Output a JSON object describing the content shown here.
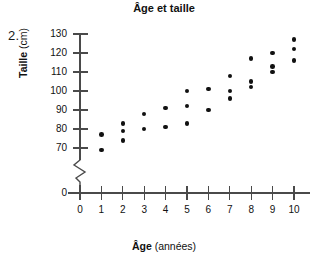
{
  "question_number": "2.",
  "chart_data": {
    "type": "scatter",
    "title": "Âge et taille",
    "xlabel": "Âge (années)",
    "xlabel_bold_part": "Âge",
    "xlabel_rest": " (années)",
    "ylabel": "Taille (cm)",
    "ylabel_bold_part": "Taille",
    "ylabel_unit": " (cm)",
    "xlim": [
      0,
      10
    ],
    "ylim": [
      65,
      132
    ],
    "y_axis_break": true,
    "y_break_note": "axis broken between 0 and 65",
    "grid": false,
    "legend": false,
    "xticks": [
      0,
      1,
      2,
      3,
      4,
      5,
      6,
      7,
      8,
      9,
      10
    ],
    "xtick_labels": [
      "0",
      "1",
      "2",
      "3",
      "4",
      "5",
      "6",
      "7",
      "8",
      "9",
      "10"
    ],
    "yticks": [
      70,
      80,
      90,
      100,
      110,
      120,
      130
    ],
    "ytick_labels": [
      "70",
      "80",
      "90",
      "100",
      "110",
      "120",
      "130"
    ],
    "y_zero_label": "0",
    "points": [
      {
        "x": 1,
        "y": 77
      },
      {
        "x": 1,
        "y": 69
      },
      {
        "x": 2,
        "y": 83
      },
      {
        "x": 2,
        "y": 79
      },
      {
        "x": 2,
        "y": 74
      },
      {
        "x": 3,
        "y": 88
      },
      {
        "x": 3,
        "y": 80
      },
      {
        "x": 4,
        "y": 91
      },
      {
        "x": 4,
        "y": 81
      },
      {
        "x": 5,
        "y": 100
      },
      {
        "x": 5,
        "y": 92
      },
      {
        "x": 5,
        "y": 83
      },
      {
        "x": 6,
        "y": 101
      },
      {
        "x": 6,
        "y": 90
      },
      {
        "x": 7,
        "y": 108
      },
      {
        "x": 7,
        "y": 100
      },
      {
        "x": 7,
        "y": 96
      },
      {
        "x": 8,
        "y": 117
      },
      {
        "x": 8,
        "y": 105
      },
      {
        "x": 8,
        "y": 102
      },
      {
        "x": 9,
        "y": 120
      },
      {
        "x": 9,
        "y": 113
      },
      {
        "x": 9,
        "y": 110
      },
      {
        "x": 10,
        "y": 127
      },
      {
        "x": 10,
        "y": 122
      },
      {
        "x": 10,
        "y": 116
      }
    ]
  },
  "colors": {
    "point": "#111111",
    "axis": "#4a4a4a",
    "text": "#111111",
    "background": "#ffffff"
  }
}
